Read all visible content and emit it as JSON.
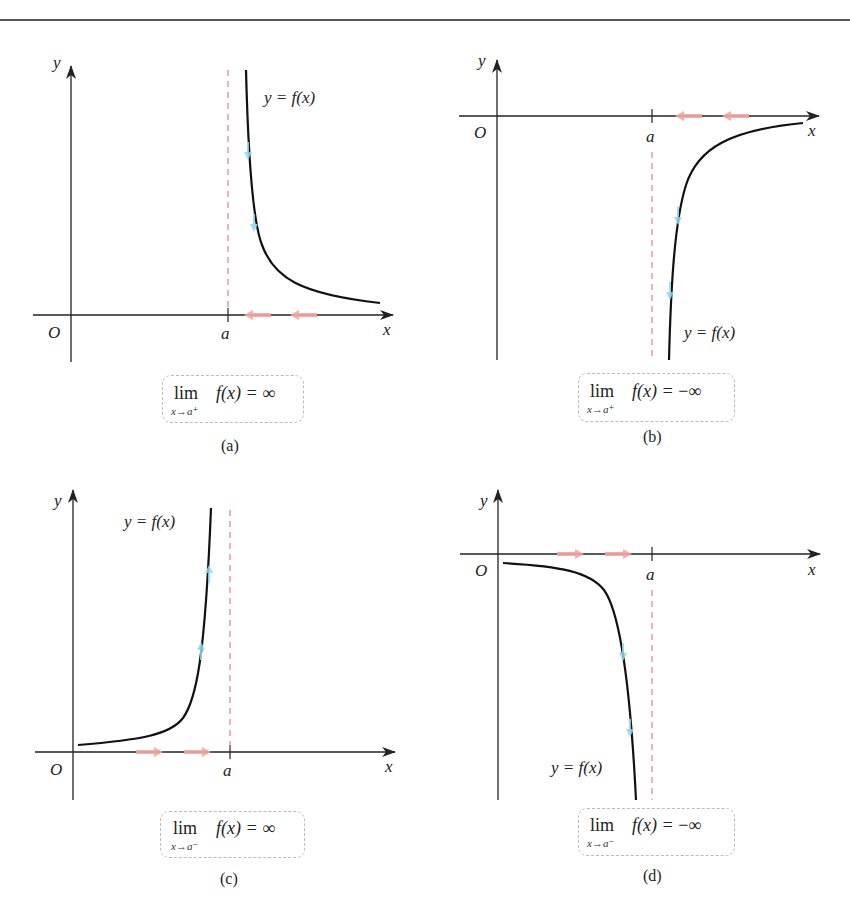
{
  "figure": {
    "panels": [
      {
        "id": "a",
        "caption": "(a)",
        "curve_label": "y = f(x)",
        "axis_labels": {
          "x": "x",
          "y": "y",
          "origin": "O",
          "asymptote": "a"
        },
        "limit": {
          "lim": "lim",
          "sub": "x→a⁺",
          "expr_func": "f(x) = ",
          "expr_value": "∞"
        },
        "description": "Curve approaches +∞ as x approaches a from the right"
      },
      {
        "id": "b",
        "caption": "(b)",
        "curve_label": "y = f(x)",
        "axis_labels": {
          "x": "x",
          "y": "y",
          "origin": "O",
          "asymptote": "a"
        },
        "limit": {
          "lim": "lim",
          "sub": "x→a⁺",
          "expr_func": "f(x) = ",
          "expr_value": "−∞"
        },
        "description": "Curve approaches −∞ as x approaches a from the right"
      },
      {
        "id": "c",
        "caption": "(c)",
        "curve_label": "y = f(x)",
        "axis_labels": {
          "x": "x",
          "y": "y",
          "origin": "O",
          "asymptote": "a"
        },
        "limit": {
          "lim": "lim",
          "sub": "x→a⁻",
          "expr_func": "f(x) = ",
          "expr_value": "∞"
        },
        "description": "Curve approaches +∞ as x approaches a from the left"
      },
      {
        "id": "d",
        "caption": "(d)",
        "curve_label": "y = f(x)",
        "axis_labels": {
          "x": "x",
          "y": "y",
          "origin": "O",
          "asymptote": "a"
        },
        "limit": {
          "lim": "lim",
          "sub": "x→a⁻",
          "expr_func": "f(x) = ",
          "expr_value": "−∞"
        },
        "description": "Curve approaches −∞ as x approaches a from the left"
      }
    ],
    "colors": {
      "curve": "#111111",
      "axis": "#222222",
      "asymptote": "#e57f8a",
      "approach_arrow": "#f4a6a0",
      "curve_arrow": "#8fd8f0",
      "box_border": "#bbbbbb"
    }
  }
}
